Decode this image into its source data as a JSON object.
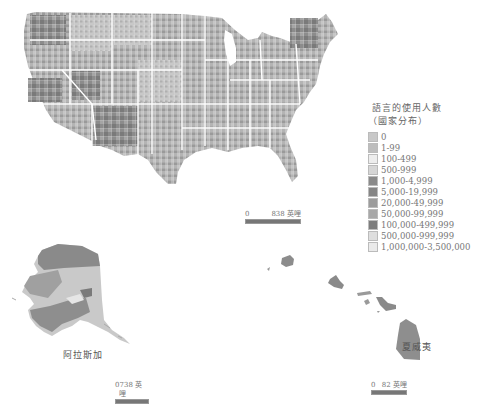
{
  "legend": {
    "title": "語言的使用人數",
    "subtitle": "（國家分布）",
    "items": [
      {
        "label": "0",
        "color": "#c8c8c8"
      },
      {
        "label": "1-99",
        "color": "#bdbdbd"
      },
      {
        "label": "100-499",
        "color": "#ededed"
      },
      {
        "label": "500-999",
        "color": "#d6d6d6"
      },
      {
        "label": "1,000-4,999",
        "color": "#8a8a8a"
      },
      {
        "label": "5,000-19,999",
        "color": "#858585"
      },
      {
        "label": "20,000-49,999",
        "color": "#9c9c9c"
      },
      {
        "label": "50,000-99,999",
        "color": "#a8a8a8"
      },
      {
        "label": "100,000-499,999",
        "color": "#7d7d7d"
      },
      {
        "label": "500,000-999,999",
        "color": "#dedede"
      },
      {
        "label": "1,000,000-3,500,000",
        "color": "#eaeaea"
      }
    ]
  },
  "scales": {
    "contiguous": {
      "start": "0",
      "end": "838",
      "unit": "英哩"
    },
    "alaska": {
      "start": "0",
      "end": "738",
      "unit": "英哩"
    },
    "hawaii": {
      "start": "0",
      "end": "82",
      "unit": "英哩"
    }
  },
  "labels": {
    "alaska": "阿拉斯加",
    "hawaii": "夏威夷"
  },
  "colors": {
    "state_border": "#ffffff",
    "land_dark": "#7d7d7d",
    "land_mid": "#a3a3a3",
    "land_light": "#d2d2d2"
  }
}
